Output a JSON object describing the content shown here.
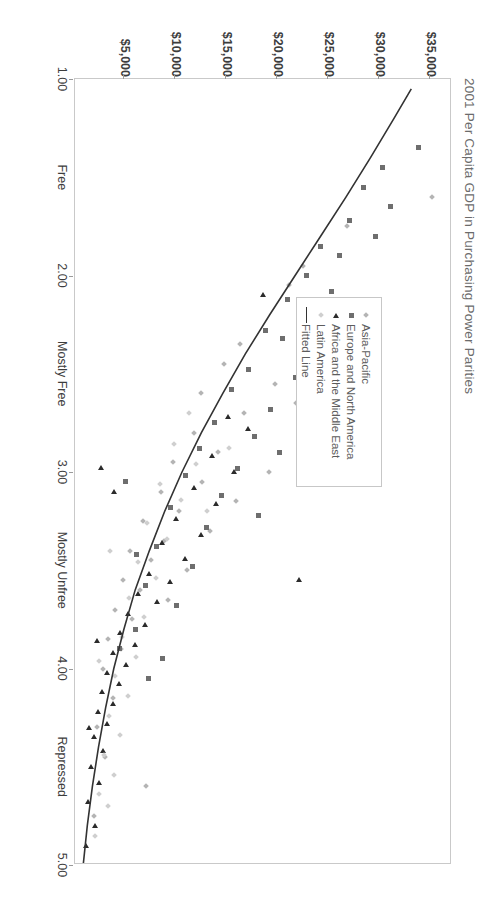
{
  "chart_data": {
    "type": "scatter",
    "title": "2001 Per Capita GDP in Purchasing Power Parities",
    "xlabel": "",
    "ylabel": "",
    "grid": false,
    "legend_position": "upper-left-inside",
    "xlim": [
      1.0,
      5.0
    ],
    "ylim": [
      0,
      37000
    ],
    "x_ticks": [
      1.0,
      1.5,
      2.0,
      2.5,
      3.0,
      3.5,
      4.0,
      4.5,
      5.0
    ],
    "x_tick_labels": [
      "1.00",
      "Free",
      "2.00",
      "Mostly Free",
      "3.00",
      "Mostly Unfree",
      "4.00",
      "Repressed",
      "5.00"
    ],
    "y_ticks": [
      35000,
      30000,
      25000,
      20000,
      15000,
      10000,
      5000
    ],
    "y_tick_labels": [
      "$35,000",
      "$30,000",
      "$25,000",
      "$20,000",
      "$15,000",
      "$10,000",
      "$5,000"
    ],
    "series": [
      {
        "name": "Asia-Pacific",
        "marker": "diamond",
        "color": "#b4b4b4",
        "points": [
          [
            1.6,
            35200
          ],
          [
            1.95,
            22600
          ],
          [
            2.25,
            24600
          ],
          [
            2.05,
            21200
          ],
          [
            1.75,
            26900
          ],
          [
            2.35,
            16400
          ],
          [
            2.55,
            19800
          ],
          [
            2.45,
            14800
          ],
          [
            2.6,
            12600
          ],
          [
            2.7,
            16800
          ],
          [
            2.8,
            11900
          ],
          [
            2.9,
            14200
          ],
          [
            2.95,
            9800
          ],
          [
            3.05,
            12700
          ],
          [
            3.1,
            8600
          ],
          [
            3.2,
            10400
          ],
          [
            3.25,
            6900
          ],
          [
            3.35,
            8900
          ],
          [
            3.4,
            5600
          ],
          [
            3.45,
            7700
          ],
          [
            3.55,
            4900
          ],
          [
            3.6,
            6600
          ],
          [
            3.7,
            4100
          ],
          [
            3.75,
            5800
          ],
          [
            3.85,
            3400
          ],
          [
            3.9,
            4700
          ],
          [
            4.0,
            2900
          ],
          [
            4.15,
            3900
          ],
          [
            4.3,
            2400
          ],
          [
            4.45,
            3100
          ],
          [
            3.0,
            19200
          ],
          [
            2.15,
            27800
          ],
          [
            2.65,
            21900
          ],
          [
            3.15,
            16000
          ],
          [
            3.5,
            11200
          ],
          [
            4.6,
            7200
          ],
          [
            4.75,
            2100
          ],
          [
            2.85,
            24100
          ],
          [
            3.3,
            13400
          ],
          [
            3.65,
            9300
          ]
        ]
      },
      {
        "name": "Europe and North America",
        "marker": "square",
        "color": "#6e6e6e",
        "points": [
          [
            1.35,
            33900
          ],
          [
            1.55,
            28500
          ],
          [
            1.65,
            31200
          ],
          [
            1.72,
            27100
          ],
          [
            1.8,
            29700
          ],
          [
            1.85,
            24300
          ],
          [
            1.9,
            26200
          ],
          [
            2.0,
            22900
          ],
          [
            2.08,
            25400
          ],
          [
            2.12,
            21100
          ],
          [
            2.2,
            23700
          ],
          [
            2.28,
            18900
          ],
          [
            2.32,
            20600
          ],
          [
            2.4,
            25800
          ],
          [
            2.48,
            17200
          ],
          [
            2.52,
            21800
          ],
          [
            2.58,
            15600
          ],
          [
            2.68,
            19400
          ],
          [
            2.75,
            13900
          ],
          [
            2.82,
            17800
          ],
          [
            2.88,
            12400
          ],
          [
            2.98,
            16100
          ],
          [
            3.02,
            11000
          ],
          [
            3.12,
            14600
          ],
          [
            3.18,
            9600
          ],
          [
            3.28,
            13100
          ],
          [
            3.38,
            8200
          ],
          [
            3.48,
            11700
          ],
          [
            3.58,
            7100
          ],
          [
            3.68,
            10200
          ],
          [
            3.8,
            6100
          ],
          [
            3.95,
            8800
          ],
          [
            1.45,
            30400
          ],
          [
            2.9,
            20300
          ],
          [
            3.22,
            18200
          ],
          [
            3.9,
            4600
          ],
          [
            4.05,
            7400
          ],
          [
            2.62,
            27600
          ],
          [
            3.42,
            6200
          ],
          [
            3.05,
            5200
          ]
        ]
      },
      {
        "name": "Africa and the Middle East",
        "marker": "triangle",
        "color": "#2b2b2b",
        "points": [
          [
            2.1,
            18600
          ],
          [
            2.5,
            22400
          ],
          [
            2.72,
            15200
          ],
          [
            2.78,
            17100
          ],
          [
            2.92,
            13600
          ],
          [
            3.0,
            15800
          ],
          [
            3.08,
            11800
          ],
          [
            3.16,
            14000
          ],
          [
            3.24,
            10100
          ],
          [
            3.32,
            12500
          ],
          [
            3.36,
            8700
          ],
          [
            3.44,
            11000
          ],
          [
            3.52,
            7400
          ],
          [
            3.56,
            9500
          ],
          [
            3.62,
            6300
          ],
          [
            3.66,
            8200
          ],
          [
            3.72,
            5400
          ],
          [
            3.78,
            7000
          ],
          [
            3.82,
            4600
          ],
          [
            3.88,
            6000
          ],
          [
            3.92,
            3900
          ],
          [
            3.98,
            5200
          ],
          [
            4.02,
            3300
          ],
          [
            4.08,
            4500
          ],
          [
            4.12,
            2800
          ],
          [
            4.18,
            3900
          ],
          [
            4.22,
            2400
          ],
          [
            4.28,
            3300
          ],
          [
            4.35,
            2000
          ],
          [
            4.42,
            2900
          ],
          [
            4.5,
            1700
          ],
          [
            4.58,
            2500
          ],
          [
            4.68,
            1400
          ],
          [
            4.8,
            2100
          ],
          [
            3.55,
            22100
          ],
          [
            4.9,
            1200
          ],
          [
            3.1,
            4000
          ],
          [
            3.86,
            2300
          ],
          [
            4.3,
            1500
          ],
          [
            2.98,
            2700
          ]
        ]
      },
      {
        "name": "Latin America",
        "marker": "diamond-light",
        "color": "#cfcfcf",
        "points": [
          [
            2.7,
            11400
          ],
          [
            2.86,
            9900
          ],
          [
            2.96,
            12100
          ],
          [
            3.06,
            8500
          ],
          [
            3.14,
            10600
          ],
          [
            3.26,
            7300
          ],
          [
            3.34,
            9200
          ],
          [
            3.46,
            6400
          ],
          [
            3.54,
            8100
          ],
          [
            3.64,
            5500
          ],
          [
            3.74,
            7000
          ],
          [
            3.84,
            4800
          ],
          [
            3.94,
            6200
          ],
          [
            4.04,
            4100
          ],
          [
            4.14,
            5400
          ],
          [
            4.24,
            3500
          ],
          [
            4.34,
            4600
          ],
          [
            4.44,
            3000
          ],
          [
            4.54,
            4000
          ],
          [
            4.64,
            2600
          ],
          [
            2.88,
            15300
          ],
          [
            3.2,
            13200
          ],
          [
            3.4,
            3600
          ],
          [
            3.96,
            2600
          ],
          [
            4.7,
            3400
          ],
          [
            4.85,
            2200
          ]
        ]
      }
    ],
    "fitted_line": {
      "name": "Fitted Line",
      "color": "#333333",
      "description": "Exponential decay fit of GDP per capita against economic freedom score",
      "points": [
        [
          1.05,
          33200
        ],
        [
          1.2,
          31500
        ],
        [
          1.4,
          29200
        ],
        [
          1.6,
          26800
        ],
        [
          1.8,
          24300
        ],
        [
          2.0,
          21800
        ],
        [
          2.2,
          19300
        ],
        [
          2.4,
          16900
        ],
        [
          2.6,
          14700
        ],
        [
          2.8,
          12600
        ],
        [
          3.0,
          10700
        ],
        [
          3.2,
          9000
        ],
        [
          3.4,
          7500
        ],
        [
          3.6,
          6100
        ],
        [
          3.8,
          5000
        ],
        [
          4.0,
          4000
        ],
        [
          4.2,
          3200
        ],
        [
          4.4,
          2500
        ],
        [
          4.6,
          1900
        ],
        [
          4.8,
          1400
        ],
        [
          5.0,
          1000
        ]
      ]
    }
  },
  "legend": {
    "items": [
      {
        "label": "Asia-Pacific",
        "symbol": "diamond"
      },
      {
        "label": "Europe and North America",
        "symbol": "square"
      },
      {
        "label": "Africa and the Middle East",
        "symbol": "triangle"
      },
      {
        "label": "Latin America",
        "symbol": "diamond-light"
      },
      {
        "label": "Fitted Line",
        "symbol": "line"
      }
    ]
  }
}
